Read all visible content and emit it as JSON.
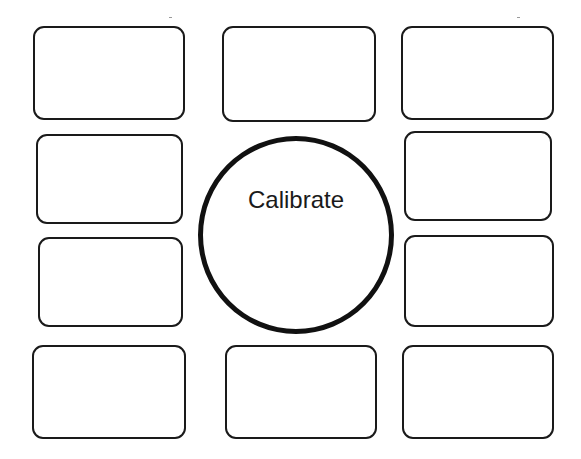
{
  "diagram": {
    "center": {
      "label": "Calibrate",
      "shape": "circle",
      "stroke_color": "#111111"
    },
    "boxes": [
      {
        "id": "top-left",
        "label": ""
      },
      {
        "id": "top-center",
        "label": ""
      },
      {
        "id": "top-right",
        "label": ""
      },
      {
        "id": "middle-upper-left",
        "label": ""
      },
      {
        "id": "middle-upper-right",
        "label": ""
      },
      {
        "id": "middle-lower-left",
        "label": ""
      },
      {
        "id": "middle-lower-right",
        "label": ""
      },
      {
        "id": "bottom-left",
        "label": ""
      },
      {
        "id": "bottom-center",
        "label": ""
      },
      {
        "id": "bottom-right",
        "label": ""
      }
    ],
    "colors": {
      "background": "#ffffff",
      "outline": "#1a1a1a"
    }
  }
}
